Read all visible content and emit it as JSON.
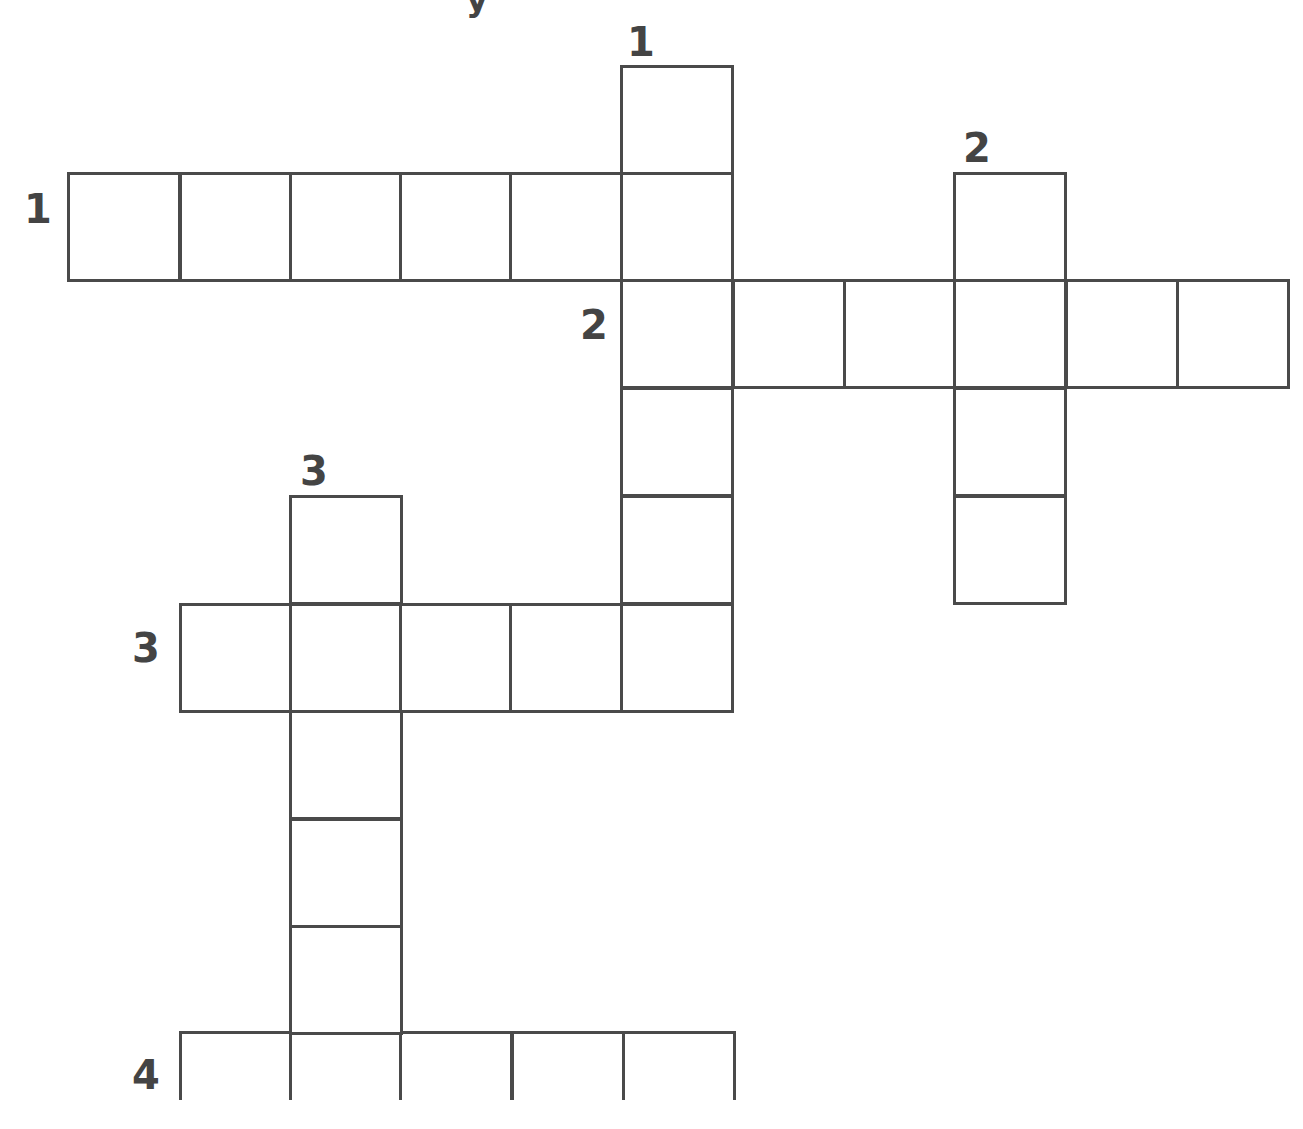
{
  "puzzle": {
    "title_fragment": "y",
    "line_color": "#4a4a4a",
    "number_color": "#444444",
    "cell_width": 111,
    "cell_height": 107,
    "clues": {
      "across": [
        {
          "number": "1",
          "label_x": 24,
          "label_y": 189,
          "cells": [
            [
              68,
              173
            ],
            [
              180,
              173
            ],
            [
              290,
              173
            ],
            [
              400,
              173
            ],
            [
              510,
              173
            ],
            [
              621,
              173
            ]
          ]
        },
        {
          "number": "2",
          "label_x": 580,
          "label_y": 305,
          "cells": [
            [
              621,
              280
            ],
            [
              733,
              280
            ],
            [
              844,
              280
            ],
            [
              954,
              280
            ],
            [
              1066,
              280
            ],
            [
              1177,
              280
            ]
          ]
        },
        {
          "number": "3",
          "label_x": 132,
          "label_y": 628,
          "cells": [
            [
              180,
              604
            ],
            [
              290,
              604
            ],
            [
              400,
              604
            ],
            [
              510,
              604
            ],
            [
              621,
              604
            ]
          ]
        },
        {
          "number": "4",
          "label_x": 132,
          "label_y": 1055,
          "cells": [
            [
              180,
              1032
            ],
            [
              290,
              1032
            ],
            [
              400,
              1032
            ],
            [
              512,
              1032
            ],
            [
              623,
              1032
            ]
          ]
        }
      ],
      "down": [
        {
          "number": "1",
          "label_x": 627,
          "label_y": 22,
          "cells": [
            [
              621,
              66
            ],
            [
              621,
              173
            ],
            [
              621,
              280
            ],
            [
              621,
              388
            ],
            [
              621,
              496
            ],
            [
              621,
              604
            ]
          ]
        },
        {
          "number": "2",
          "label_x": 963,
          "label_y": 128,
          "cells": [
            [
              954,
              173
            ],
            [
              954,
              280
            ],
            [
              954,
              388
            ],
            [
              954,
              496
            ]
          ]
        },
        {
          "number": "3",
          "label_x": 300,
          "label_y": 451,
          "cells": [
            [
              290,
              496
            ],
            [
              290,
              604
            ],
            [
              290,
              711
            ],
            [
              290,
              819
            ],
            [
              290,
              926
            ],
            [
              290,
              1032
            ]
          ]
        }
      ]
    }
  }
}
